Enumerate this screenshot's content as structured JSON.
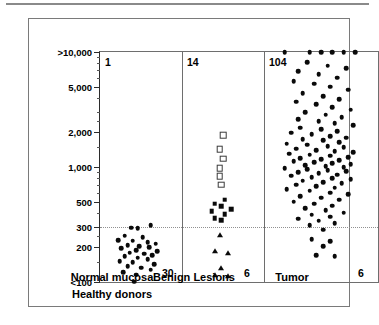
{
  "chart_data": {
    "type": "scatter",
    "title": "",
    "xlabel": "",
    "ylabel": "CEA tissue content (ng/mg protein)",
    "yscale": "log",
    "ylim": [
      100,
      10000
    ],
    "grid": false,
    "legend_position": "none",
    "ytick_labels": [
      ">10,000",
      "5,000",
      "2,000",
      "1,000",
      "500",
      "300",
      "200",
      "<100"
    ],
    "ytick_values": [
      10000,
      5000,
      2000,
      1000,
      500,
      300,
      200,
      100
    ],
    "threshold_line": {
      "value": 300,
      "style": "dotted",
      "label": ""
    },
    "groups": [
      {
        "name": "normal-mucosa",
        "label": "Normal mucosa",
        "sublabel": "Healthy donors",
        "count_top": "1",
        "count_bottom": "30",
        "series": [
          {
            "name": "normal mucosa",
            "marker": "circle",
            "values": [
              310,
              297,
              295,
              252,
              246,
              232,
              228,
              222,
              215,
              210,
              205,
              200,
              196,
              190,
              186,
              180,
              176,
              172,
              168,
              162,
              158,
              152,
              148,
              143,
              138,
              133,
              128,
              122,
              116,
              101
            ],
            "jitter": [
              0.62,
              0.38,
              0.46,
              0.3,
              0.52,
              0.22,
              0.4,
              0.58,
              0.68,
              0.34,
              0.48,
              0.6,
              0.26,
              0.44,
              0.7,
              0.36,
              0.54,
              0.64,
              0.3,
              0.46,
              0.58,
              0.24,
              0.4,
              0.66,
              0.34,
              0.5,
              0.62,
              0.28,
              0.44,
              0.42
            ]
          }
        ]
      },
      {
        "name": "benign-lesions",
        "label": "Benign Lesions",
        "sublabel": "",
        "count_top": "14",
        "count_bottom": "6",
        "series": [
          {
            "name": "benign open",
            "marker": "osquare",
            "values": [
              1900,
              1420,
              1180,
              980,
              830,
              700
            ],
            "jitter": [
              0.5,
              0.46,
              0.5,
              0.46,
              0.46,
              0.48
            ]
          },
          {
            "name": "benign filled",
            "marker": "fsquare",
            "values": [
              520,
              480,
              455,
              430,
              415,
              390,
              360,
              345
            ],
            "jitter": [
              0.52,
              0.4,
              0.48,
              0.6,
              0.36,
              0.52,
              0.4,
              0.48
            ]
          },
          {
            "name": "benign triangles",
            "marker": "triangle",
            "values": [
              255,
              186,
              180,
              132,
              115,
              113
            ],
            "jitter": [
              0.46,
              0.4,
              0.56,
              0.48,
              0.4,
              0.56
            ]
          }
        ]
      },
      {
        "name": "tumor",
        "label": "Tumor",
        "sublabel": "",
        "count_top": "104",
        "count_bottom": "6",
        "series": [
          {
            "name": "tumor",
            "marker": "circle",
            "values": [
              10000,
              10000,
              10000,
              10000,
              10000,
              10000,
              8200,
              7600,
              7200,
              6800,
              6400,
              6000,
              5600,
              5300,
              5000,
              4700,
              4400,
              4150,
              3900,
              3700,
              3500,
              3300,
              3150,
              3000,
              2850,
              2700,
              2600,
              2500,
              2400,
              2300,
              2200,
              2120,
              2050,
              1980,
              1920,
              1860,
              1800,
              1750,
              1700,
              1650,
              1600,
              1560,
              1520,
              1480,
              1440,
              1400,
              1370,
              1340,
              1310,
              1280,
              1250,
              1220,
              1195,
              1170,
              1145,
              1120,
              1100,
              1080,
              1060,
              1040,
              1020,
              1000,
              980,
              960,
              940,
              920,
              900,
              880,
              860,
              840,
              820,
              800,
              780,
              760,
              740,
              720,
              700,
              680,
              660,
              640,
              620,
              600,
              580,
              560,
              540,
              520,
              500,
              480,
              460,
              440,
              420,
              400,
              385,
              370,
              355,
              340,
              325,
              310,
              285,
              235,
              225,
              205,
              170,
              168
            ],
            "jitter": [
              0.18,
              0.4,
              0.5,
              0.6,
              0.7,
              0.8,
              0.38,
              0.56,
              0.72,
              0.3,
              0.48,
              0.64,
              0.26,
              0.44,
              0.58,
              0.74,
              0.34,
              0.52,
              0.66,
              0.28,
              0.46,
              0.6,
              0.76,
              0.36,
              0.54,
              0.68,
              0.3,
              0.48,
              0.62,
              0.78,
              0.32,
              0.5,
              0.64,
              0.24,
              0.42,
              0.58,
              0.72,
              0.34,
              0.52,
              0.66,
              0.2,
              0.38,
              0.56,
              0.7,
              0.28,
              0.46,
              0.62,
              0.78,
              0.22,
              0.4,
              0.58,
              0.74,
              0.32,
              0.5,
              0.66,
              0.26,
              0.44,
              0.6,
              0.76,
              0.36,
              0.54,
              0.7,
              0.18,
              0.38,
              0.56,
              0.72,
              0.3,
              0.48,
              0.64,
              0.24,
              0.42,
              0.6,
              0.76,
              0.34,
              0.52,
              0.68,
              0.28,
              0.46,
              0.62,
              0.2,
              0.4,
              0.58,
              0.74,
              0.32,
              0.5,
              0.66,
              0.26,
              0.44,
              0.6,
              0.36,
              0.54,
              0.7,
              0.42,
              0.58,
              0.3,
              0.48,
              0.62,
              0.4,
              0.52,
              0.42,
              0.58,
              0.52,
              0.46,
              0.62
            ]
          }
        ]
      }
    ]
  }
}
